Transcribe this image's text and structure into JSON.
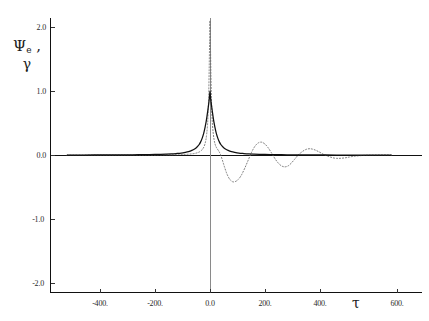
{
  "chart_data": {
    "type": "line",
    "title": "",
    "xlabel": "τ",
    "ylabel": "Ψₑ , γ",
    "ylabel_parts": {
      "symbol": "Ψ",
      "subscript": "e",
      "second_symbol": "γ"
    },
    "xlim": [
      -520,
      660
    ],
    "ylim": [
      -2.35,
      2.25
    ],
    "grid": false,
    "legend": "none",
    "x_ticks": [
      -400,
      -200,
      0,
      200,
      400,
      600
    ],
    "x_tick_labels": [
      "-400.",
      "-200.",
      "0.0",
      "200.",
      "400.",
      "600."
    ],
    "y_ticks": [
      -2.0,
      -1.0,
      0.0,
      1.0,
      2.0
    ],
    "y_tick_labels": [
      "-2.0",
      "-1.0",
      "0.0",
      "1.0",
      "2.0"
    ],
    "zero_line_y": 0.0,
    "series": [
      {
        "name": "solid-envelope",
        "style": "solid",
        "color": "#111111",
        "description": "Smooth symmetric Lorentzian-like peak centred at tau = 0 with maximum 1.0, decaying to 0 on both sides.",
        "x": [
          -520,
          -460,
          -400,
          -340,
          -300,
          -260,
          -220,
          -190,
          -160,
          -140,
          -120,
          -105,
          -90,
          -78,
          -66,
          -56,
          -48,
          -40,
          -34,
          -28,
          -23,
          -18,
          -14,
          -10,
          -7,
          -4,
          -2,
          0,
          2,
          4,
          7,
          10,
          14,
          18,
          23,
          28,
          34,
          40,
          48,
          56,
          66,
          78,
          90,
          105,
          120,
          140,
          160,
          190,
          220,
          260,
          300,
          340,
          400,
          460,
          520,
          600,
          660
        ],
        "y": [
          0.0,
          0.0,
          0.001,
          0.002,
          0.003,
          0.004,
          0.006,
          0.009,
          0.013,
          0.017,
          0.024,
          0.03,
          0.041,
          0.053,
          0.072,
          0.095,
          0.122,
          0.16,
          0.205,
          0.268,
          0.337,
          0.432,
          0.52,
          0.634,
          0.724,
          0.822,
          0.9,
          1.0,
          0.9,
          0.822,
          0.724,
          0.634,
          0.52,
          0.432,
          0.337,
          0.268,
          0.205,
          0.16,
          0.122,
          0.095,
          0.072,
          0.053,
          0.041,
          0.03,
          0.024,
          0.017,
          0.013,
          0.009,
          0.006,
          0.004,
          0.003,
          0.002,
          0.001,
          0.0,
          0.0,
          0.0,
          0.0
        ]
      },
      {
        "name": "dotted-oscillatory",
        "style": "dotted",
        "color": "#6e6e6e",
        "description": "Narrow peak reaching about 2.1 at tau = 0, damped oscillation on the positive tau side crossing zero several times, flat at zero for negative tau beyond the peak.",
        "x": [
          -520,
          -420,
          -340,
          -280,
          -230,
          -190,
          -160,
          -135,
          -115,
          -98,
          -84,
          -72,
          -62,
          -53,
          -45,
          -38,
          -32,
          -27,
          -22,
          -18,
          -15,
          -12,
          -9,
          -7,
          -5,
          -3,
          -1.5,
          0,
          1.5,
          3,
          5,
          7,
          9,
          12,
          15,
          18,
          22,
          27,
          32,
          38,
          45,
          53,
          62,
          72,
          84,
          98,
          112,
          126,
          140,
          152,
          164,
          176,
          188,
          200,
          212,
          224,
          236,
          248,
          260,
          272,
          284,
          296,
          308,
          320,
          334,
          348,
          362,
          378,
          396,
          414,
          436,
          460,
          490,
          520,
          560,
          600,
          660
        ],
        "y": [
          0.0,
          0.0,
          0.0,
          0.001,
          0.001,
          0.002,
          0.003,
          0.004,
          0.006,
          0.008,
          0.011,
          0.015,
          0.02,
          0.027,
          0.037,
          0.05,
          0.068,
          0.092,
          0.128,
          0.178,
          0.235,
          0.33,
          0.47,
          0.64,
          0.9,
          1.33,
          1.76,
          2.1,
          1.76,
          1.33,
          0.9,
          0.64,
          0.47,
          0.33,
          0.235,
          0.178,
          0.128,
          0.092,
          0.06,
          0.01,
          -0.08,
          -0.19,
          -0.3,
          -0.38,
          -0.42,
          -0.4,
          -0.33,
          -0.21,
          -0.07,
          0.05,
          0.14,
          0.19,
          0.2,
          0.17,
          0.11,
          0.03,
          -0.055,
          -0.125,
          -0.17,
          -0.185,
          -0.17,
          -0.125,
          -0.065,
          -0.005,
          0.048,
          0.085,
          0.098,
          0.085,
          0.05,
          0.008,
          -0.03,
          -0.052,
          -0.045,
          -0.022,
          -0.006,
          0.0,
          0.0
        ]
      }
    ]
  }
}
